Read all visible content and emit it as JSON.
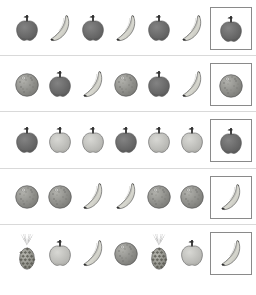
{
  "worksheet": {
    "title": "Fruit Pattern Completion Worksheet",
    "palette": {
      "apple_dark": "#6b6b6b",
      "apple_light": "#c0c0bc",
      "banana": "#d8d8d0",
      "orange": "#8a8a8a",
      "pineapple_body": "#9a9a94",
      "pineapple_crown": "#3a3a3a",
      "outline": "#4a4a4a",
      "divider": "#d9d9d9",
      "box_border": "#8a8a8a",
      "background": "#ffffff"
    },
    "rows": [
      {
        "index": 1,
        "pattern": [
          "apple-dark",
          "banana",
          "apple-dark",
          "banana",
          "apple-dark",
          "banana"
        ],
        "answer": "apple-dark"
      },
      {
        "index": 2,
        "pattern": [
          "orange",
          "apple-dark",
          "banana",
          "orange",
          "apple-dark",
          "banana"
        ],
        "answer": "orange"
      },
      {
        "index": 3,
        "pattern": [
          "apple-dark",
          "apple-light",
          "apple-light",
          "apple-dark",
          "apple-light",
          "apple-light"
        ],
        "answer": "apple-dark"
      },
      {
        "index": 4,
        "pattern": [
          "orange",
          "orange",
          "banana",
          "banana",
          "orange",
          "orange"
        ],
        "answer": "banana"
      },
      {
        "index": 5,
        "pattern": [
          "pineapple",
          "apple-light",
          "banana",
          "orange",
          "pineapple",
          "apple-light"
        ],
        "answer": "banana"
      }
    ],
    "icon_names": {
      "apple-dark": "apple-dark-icon",
      "apple-light": "apple-light-icon",
      "banana": "banana-icon",
      "orange": "orange-icon",
      "pineapple": "pineapple-icon"
    }
  }
}
